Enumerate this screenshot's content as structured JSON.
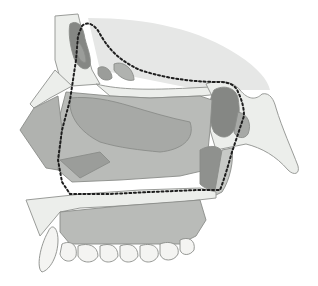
{
  "figure": {
    "style": "grayscale medical illustration",
    "outline": "dotted boundary around nasal cavity / sinus region",
    "colors": {
      "background": "#ffffff",
      "skull_shade": "#e6e7e6",
      "bone": "#eceeeb",
      "bone_speckle": "#b8bab7",
      "cavity_light": "#b9bbb8",
      "cavity_mid": "#a7a9a6",
      "sinus_dark": "#858784",
      "sinus_medium": "#9b9d9a",
      "teeth": "#f4f4f2",
      "dotted_line": "#1e1e1e",
      "outline": "#8a8c89"
    },
    "regions": [
      "frontal-sinus",
      "sphenoid-sinus",
      "nasal-cavity",
      "maxillary-region",
      "hard-palate",
      "upper-teeth",
      "occipital-bone-process",
      "nasal-bone"
    ]
  }
}
